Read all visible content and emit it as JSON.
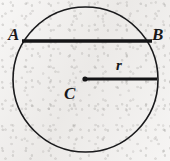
{
  "figure": {
    "kind": "geometry-diagram",
    "background_color": "#eeedea",
    "ink_color": "#1a1a1c",
    "labels": {
      "a": "A",
      "b": "B",
      "c": "C",
      "r": "r"
    },
    "geometry": {
      "circle": {
        "center_x": 85.5,
        "center_y": 79.5,
        "radius": 72.5,
        "stroke_width": 1.6
      },
      "chord_ab": {
        "x1": 22,
        "y1": 41,
        "x2": 152,
        "y2": 41,
        "stroke_width": 3.4
      },
      "radius_segment": {
        "x1": 85,
        "y1": 79,
        "x2": 157,
        "y2": 79,
        "stroke_width": 3.2
      },
      "center_dot": {
        "cx": 85,
        "cy": 79,
        "r": 2.6
      }
    }
  }
}
